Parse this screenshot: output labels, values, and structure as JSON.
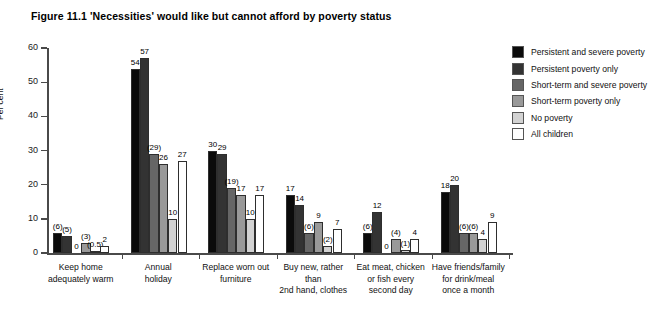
{
  "figure": {
    "title": "Figure 11.1  'Necessities' would like but cannot afford by poverty status"
  },
  "chart_data": {
    "type": "bar",
    "title": "Figure 11.1  'Necessities' would like but cannot afford by poverty status",
    "xlabel": "",
    "ylabel": "Per cent",
    "ylim": [
      0,
      60
    ],
    "ytick_labels": [
      "0",
      "10",
      "20",
      "30",
      "40",
      "50",
      "60"
    ],
    "ytick_values": [
      0,
      10,
      20,
      30,
      40,
      50,
      60
    ],
    "grid": false,
    "legend_position": "right",
    "categories": [
      "Keep home adequately warm",
      "Annual holiday",
      "Replace worn out furniture",
      "Buy new, rather than 2nd hand, clothes",
      "Eat meat, chicken or fish every second day",
      "Have friends/family for drink/meal once a month"
    ],
    "category_lines": [
      [
        "Keep home",
        "adequately warm"
      ],
      [
        "Annual",
        "holiday"
      ],
      [
        "Replace worn out",
        "furniture"
      ],
      [
        "Buy new, rather than",
        "2nd hand, clothes"
      ],
      [
        "Eat meat, chicken",
        "or fish every",
        "second day"
      ],
      [
        "Have friends/family",
        "for drink/meal",
        "once a month"
      ]
    ],
    "series": [
      {
        "name": "Persistent and severe poverty",
        "color": "#0b0b0b",
        "values": [
          6,
          54,
          30,
          17,
          6,
          18
        ],
        "labels": [
          "(6)",
          "54",
          "30",
          "17",
          "(6)",
          "18"
        ]
      },
      {
        "name": "Persistent poverty only",
        "color": "#333333",
        "values": [
          5,
          57,
          29,
          14,
          12,
          20
        ],
        "labels": [
          "(5)",
          "57",
          "29",
          "14",
          "12",
          "20"
        ]
      },
      {
        "name": "Short-term and severe poverty",
        "color": "#666666",
        "values": [
          0,
          29,
          19,
          6,
          0,
          6
        ],
        "labels": [
          "0",
          "(29)",
          "(19)",
          "(6)",
          "0",
          "(6)"
        ]
      },
      {
        "name": "Short-term poverty only",
        "color": "#999999",
        "values": [
          3,
          26,
          17,
          9,
          4,
          6
        ],
        "labels": [
          "(3)",
          "26",
          "17",
          "9",
          "(4)",
          "(6)"
        ]
      },
      {
        "name": "No poverty",
        "color": "#d2d2d2",
        "values": [
          0.5,
          10,
          10,
          2,
          1,
          4
        ],
        "labels": [
          "(0.5)",
          "10",
          "10",
          "(2)",
          "(1)",
          "4"
        ]
      },
      {
        "name": "All children",
        "color": "#ffffff",
        "values": [
          2,
          27,
          17,
          7,
          4,
          9
        ],
        "labels": [
          "2",
          "27",
          "17",
          "7",
          "4",
          "9"
        ]
      }
    ]
  },
  "legend": {
    "items": [
      {
        "label": "Persistent and severe poverty",
        "color": "#0b0b0b"
      },
      {
        "label": "Persistent poverty only",
        "color": "#333333"
      },
      {
        "label": "Short-term and severe poverty",
        "color": "#666666"
      },
      {
        "label": "Short-term poverty only",
        "color": "#999999"
      },
      {
        "label": "No poverty",
        "color": "#d2d2d2"
      },
      {
        "label": "All children",
        "color": "#ffffff"
      }
    ]
  }
}
